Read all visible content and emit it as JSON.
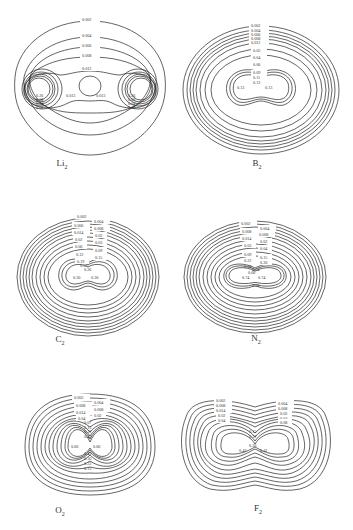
{
  "header": {
    "text": ""
  },
  "panels": [
    {
      "id": "li2",
      "molecule": "Li",
      "subscript": "2",
      "contour_labels": [
        "0.002",
        "0.004",
        "0.006",
        "0.008",
        "0.012",
        "0.013",
        "0.013",
        "0.26",
        "0.08",
        "0.04",
        "0.02",
        "0.26",
        "0.08",
        "0.04",
        "0.02"
      ]
    },
    {
      "id": "b2",
      "molecule": "B",
      "subscript": "2",
      "contour_labels": [
        "0.002",
        "0.004",
        "0.006",
        "0.008",
        "0.012",
        "0.02",
        "0.04",
        "0.06",
        "0.09",
        "0.11",
        "0.12",
        "0.13",
        "0.13"
      ]
    },
    {
      "id": "c2",
      "molecule": "C",
      "subscript": "2",
      "contour_labels": [
        "0.002",
        "0.004",
        "0.006",
        "0.008",
        "0.014",
        "0.02",
        "0.02",
        "0.03",
        "0.06",
        "0.09",
        "0.12",
        "0.15",
        "0.19",
        "0.22",
        "0.26",
        "0.30",
        "0.30"
      ]
    },
    {
      "id": "n2",
      "molecule": "N",
      "subscript": "2",
      "contour_labels": [
        "0.002",
        "0.004",
        "0.008",
        "0.008",
        "0.014",
        "0.02",
        "0.03",
        "0.04",
        "0.09",
        "0.15",
        "0.22",
        "0.30",
        "0.38",
        "0.54",
        "0.66",
        "0.74",
        "0.74",
        "0.58"
      ]
    },
    {
      "id": "o2",
      "molecule": "O",
      "subscript": "2",
      "contour_labels": [
        "0.002",
        "0.004",
        "0.008",
        "0.008",
        "0.014",
        "0.02",
        "0.04",
        "0.07",
        "0.15",
        "0.22",
        "0.42",
        "0.60",
        "0.66",
        "0.42",
        "0.30",
        "0.22",
        "0.15"
      ]
    },
    {
      "id": "f2",
      "molecule": "F",
      "subscript": "2",
      "contour_labels": [
        "0.002",
        "0.004",
        "0.008",
        "0.008",
        "0.014",
        "0.02",
        "0.02",
        "0.04",
        "0.04",
        "0.08",
        "0.15",
        "0.22",
        "0.30",
        "0.42",
        "0.42"
      ]
    }
  ]
}
